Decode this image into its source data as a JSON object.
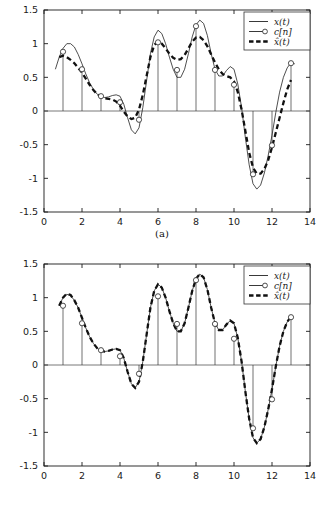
{
  "figure": {
    "title": "",
    "panels": [
      {
        "caption": "(a)"
      },
      {
        "caption": "(b)"
      }
    ]
  },
  "chart_data": [
    {
      "type": "line",
      "title": "",
      "panel": "(a)",
      "xlabel": "",
      "ylabel": "",
      "xlim": [
        0,
        14
      ],
      "ylim": [
        -1.5,
        1.5
      ],
      "xticks": [
        0,
        2,
        4,
        6,
        8,
        10,
        12,
        14
      ],
      "yticks": [
        -1.5,
        -1,
        -0.5,
        0,
        0.5,
        1,
        1.5
      ],
      "xticklabels": [
        "0",
        "2",
        "4",
        "6",
        "8",
        "10",
        "12",
        "14"
      ],
      "yticklabels": [
        "-1.5",
        "-1",
        "-0.5",
        "0",
        "0.5",
        "1",
        "1.5"
      ],
      "grid": false,
      "legend": {
        "position": "upper right",
        "entries": [
          "x(t)",
          "c[n]",
          "x̂(t)"
        ]
      },
      "series": [
        {
          "name": "x(t)",
          "style": "solid-thin",
          "x": [
            0.6,
            0.8,
            1.0,
            1.2,
            1.4,
            1.6,
            1.8,
            2.0,
            2.2,
            2.4,
            2.6,
            2.8,
            3.0,
            3.2,
            3.4,
            3.6,
            3.8,
            4.0,
            4.2,
            4.4,
            4.6,
            4.8,
            5.0,
            5.2,
            5.4,
            5.6,
            5.8,
            6.0,
            6.2,
            6.4,
            6.6,
            6.8,
            7.0,
            7.2,
            7.4,
            7.6,
            7.8,
            8.0,
            8.2,
            8.4,
            8.6,
            8.8,
            9.0,
            9.2,
            9.4,
            9.6,
            9.8,
            10.0,
            10.2,
            10.4,
            10.6,
            10.8,
            11.0,
            11.2,
            11.4,
            11.6,
            11.8,
            12.0,
            12.2,
            12.4,
            12.6,
            12.8,
            13.0,
            13.2
          ],
          "y": [
            0.62,
            0.8,
            0.93,
            1.0,
            1.0,
            0.95,
            0.84,
            0.7,
            0.55,
            0.42,
            0.32,
            0.25,
            0.21,
            0.2,
            0.21,
            0.23,
            0.24,
            0.22,
            0.1,
            -0.1,
            -0.28,
            -0.34,
            -0.25,
            0.05,
            0.45,
            0.85,
            1.1,
            1.2,
            1.15,
            1.0,
            0.8,
            0.62,
            0.5,
            0.5,
            0.62,
            0.85,
            1.1,
            1.28,
            1.35,
            1.3,
            1.12,
            0.85,
            0.62,
            0.52,
            0.52,
            0.6,
            0.66,
            0.62,
            0.4,
            0.05,
            -0.4,
            -0.8,
            -1.08,
            -1.16,
            -1.1,
            -0.92,
            -0.66,
            -0.36,
            -0.02,
            0.28,
            0.5,
            0.64,
            0.72,
            0.7
          ]
        },
        {
          "name": "c[n]",
          "style": "stem-circle",
          "x": [
            1,
            2,
            3,
            4,
            5,
            6,
            7,
            8,
            9,
            10,
            11,
            12,
            13
          ],
          "y": [
            0.88,
            0.62,
            0.22,
            0.13,
            -0.13,
            1.02,
            0.61,
            1.26,
            0.61,
            0.39,
            -0.94,
            -0.51,
            0.71
          ]
        },
        {
          "name": "x̂(t)",
          "style": "thick-dashed",
          "x": [
            0.8,
            1.0,
            1.2,
            1.4,
            1.6,
            1.8,
            2.0,
            2.2,
            2.4,
            2.6,
            2.8,
            3.0,
            3.2,
            3.4,
            3.6,
            3.8,
            4.0,
            4.2,
            4.4,
            4.6,
            4.8,
            5.0,
            5.2,
            5.4,
            5.6,
            5.8,
            6.0,
            6.2,
            6.4,
            6.6,
            6.8,
            7.0,
            7.2,
            7.4,
            7.6,
            7.8,
            8.0,
            8.2,
            8.4,
            8.6,
            8.8,
            9.0,
            9.2,
            9.4,
            9.6,
            9.8,
            10.0,
            10.2,
            10.4,
            10.6,
            10.8,
            11.0,
            11.2,
            11.4,
            11.6,
            11.8,
            12.0,
            12.2,
            12.4,
            12.6,
            12.8,
            13.0
          ],
          "y": [
            0.8,
            0.82,
            0.8,
            0.76,
            0.71,
            0.64,
            0.57,
            0.48,
            0.39,
            0.31,
            0.25,
            0.21,
            0.19,
            0.18,
            0.17,
            0.14,
            0.08,
            -0.01,
            -0.08,
            -0.12,
            -0.1,
            0.02,
            0.24,
            0.52,
            0.8,
            0.98,
            1.03,
            1.0,
            0.93,
            0.85,
            0.79,
            0.76,
            0.77,
            0.83,
            0.93,
            1.03,
            1.09,
            1.1,
            1.05,
            0.96,
            0.84,
            0.72,
            0.62,
            0.55,
            0.52,
            0.5,
            0.44,
            0.28,
            0.02,
            -0.3,
            -0.62,
            -0.84,
            -0.93,
            -0.93,
            -0.86,
            -0.73,
            -0.54,
            -0.32,
            -0.1,
            0.12,
            0.32,
            0.46
          ]
        }
      ]
    },
    {
      "type": "line",
      "title": "",
      "panel": "(b)",
      "xlabel": "",
      "ylabel": "",
      "xlim": [
        0,
        14
      ],
      "ylim": [
        -1.5,
        1.5
      ],
      "xticks": [
        0,
        2,
        4,
        6,
        8,
        10,
        12,
        14
      ],
      "yticks": [
        -1.5,
        -1,
        -0.5,
        0,
        0.5,
        1,
        1.5
      ],
      "xticklabels": [
        "0",
        "2",
        "4",
        "6",
        "8",
        "10",
        "12",
        "14"
      ],
      "yticklabels": [
        "-1.5",
        "-1",
        "-0.5",
        "0",
        "0.5",
        "1",
        "1.5"
      ],
      "grid": false,
      "legend": {
        "position": "upper right",
        "entries": [
          "x(t)",
          "c[n]",
          "x̂(t)"
        ]
      },
      "series": [
        {
          "name": "x(t)",
          "style": "solid-thin",
          "x": [
            0.8,
            1.0,
            1.2,
            1.4,
            1.6,
            1.8,
            2.0,
            2.2,
            2.4,
            2.6,
            2.8,
            3.0,
            3.2,
            3.4,
            3.6,
            3.8,
            4.0,
            4.2,
            4.4,
            4.6,
            4.8,
            5.0,
            5.2,
            5.4,
            5.6,
            5.8,
            6.0,
            6.2,
            6.4,
            6.6,
            6.8,
            7.0,
            7.2,
            7.4,
            7.6,
            7.8,
            8.0,
            8.2,
            8.4,
            8.6,
            8.8,
            9.0,
            9.2,
            9.4,
            9.6,
            9.8,
            10.0,
            10.2,
            10.4,
            10.6,
            10.8,
            11.0,
            11.2,
            11.4,
            11.6,
            11.8,
            12.0,
            12.2,
            12.4,
            12.6,
            12.8,
            13.0
          ],
          "y": [
            0.88,
            1.0,
            1.05,
            1.03,
            0.96,
            0.85,
            0.7,
            0.55,
            0.42,
            0.32,
            0.25,
            0.21,
            0.2,
            0.21,
            0.23,
            0.24,
            0.22,
            0.1,
            -0.1,
            -0.28,
            -0.34,
            -0.25,
            0.05,
            0.45,
            0.85,
            1.1,
            1.2,
            1.15,
            1.0,
            0.8,
            0.62,
            0.5,
            0.5,
            0.62,
            0.85,
            1.1,
            1.28,
            1.35,
            1.3,
            1.12,
            0.85,
            0.62,
            0.52,
            0.52,
            0.6,
            0.66,
            0.62,
            0.4,
            0.05,
            -0.4,
            -0.8,
            -1.08,
            -1.16,
            -1.1,
            -0.92,
            -0.66,
            -0.36,
            -0.02,
            0.28,
            0.5,
            0.64,
            0.72
          ]
        },
        {
          "name": "c[n]",
          "style": "stem-circle",
          "x": [
            1,
            2,
            3,
            4,
            5,
            6,
            7,
            8,
            9,
            10,
            11,
            12,
            13
          ],
          "y": [
            0.88,
            0.62,
            0.22,
            0.13,
            -0.13,
            1.02,
            0.61,
            1.26,
            0.61,
            0.39,
            -0.94,
            -0.51,
            0.71
          ]
        },
        {
          "name": "x̂(t)",
          "style": "thick-dashed",
          "x": [
            0.8,
            1.0,
            1.2,
            1.4,
            1.6,
            1.8,
            2.0,
            2.2,
            2.4,
            2.6,
            2.8,
            3.0,
            3.2,
            3.4,
            3.6,
            3.8,
            4.0,
            4.2,
            4.4,
            4.6,
            4.8,
            5.0,
            5.2,
            5.4,
            5.6,
            5.8,
            6.0,
            6.2,
            6.4,
            6.6,
            6.8,
            7.0,
            7.2,
            7.4,
            7.6,
            7.8,
            8.0,
            8.2,
            8.4,
            8.6,
            8.8,
            9.0,
            9.2,
            9.4,
            9.6,
            9.8,
            10.0,
            10.2,
            10.4,
            10.6,
            10.8,
            11.0,
            11.2,
            11.4,
            11.6,
            11.8,
            12.0,
            12.2,
            12.4,
            12.6,
            12.8,
            13.0
          ],
          "y": [
            0.88,
            1.0,
            1.06,
            1.04,
            0.96,
            0.85,
            0.7,
            0.55,
            0.42,
            0.32,
            0.25,
            0.21,
            0.2,
            0.21,
            0.23,
            0.24,
            0.22,
            0.1,
            -0.1,
            -0.28,
            -0.34,
            -0.25,
            0.05,
            0.45,
            0.85,
            1.1,
            1.2,
            1.15,
            1.0,
            0.8,
            0.62,
            0.5,
            0.5,
            0.62,
            0.85,
            1.1,
            1.28,
            1.35,
            1.3,
            1.12,
            0.85,
            0.62,
            0.52,
            0.52,
            0.6,
            0.66,
            0.62,
            0.4,
            0.05,
            -0.4,
            -0.8,
            -1.08,
            -1.16,
            -1.1,
            -0.92,
            -0.66,
            -0.36,
            -0.02,
            0.28,
            0.5,
            0.64,
            0.72
          ]
        }
      ]
    }
  ]
}
